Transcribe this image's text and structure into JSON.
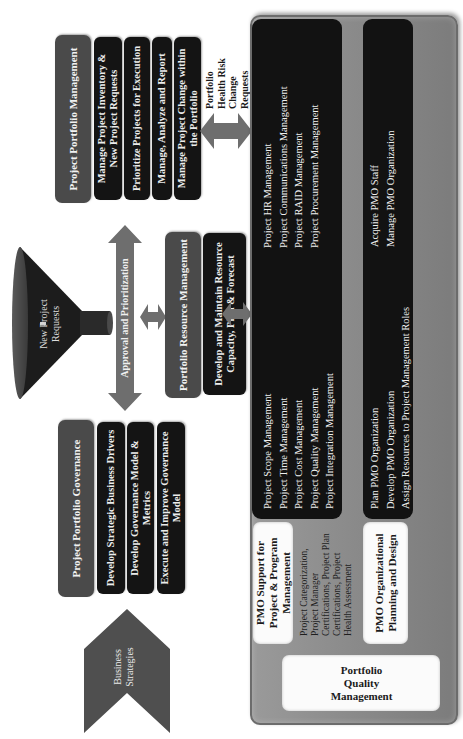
{
  "business_strategies": {
    "label_line1": "Business",
    "label_line2": "Strategies"
  },
  "governance": {
    "header": "Project Portfolio Governance",
    "items": [
      "Develop Strategic Business Drivers",
      "Develop Governance Model & Metrics",
      "Execute and Improve Governance Model"
    ]
  },
  "funnel": {
    "label": "New Project Requests"
  },
  "approval_arrow": {
    "label": "Approval and Prioritization"
  },
  "resource": {
    "header": "Portfolio Resource Management",
    "detail": "Develop and Maintain Resource Capacity, Plan & Forecast"
  },
  "portfolio_mgmt": {
    "header": "Project Portfolio Management",
    "items": [
      "Manage Project Inventory & New Project Requests",
      "Prioritize Projects for Execution",
      "Manage, Analyze and Report",
      "Manage Project Change within the Portfolio"
    ]
  },
  "feedback_arrow": {
    "label_lines": [
      "Portfolio",
      "Health Risk",
      "Change",
      "Requests"
    ]
  },
  "pmo_panel": {
    "support_box": "PMO Support for Project & Program Management",
    "support_desc": "Project Categorization, Project Manager Certifications, Project Plan Certifications, Project Health Assessment",
    "knowledge_areas_left": [
      "Project Scope Management",
      "Project Time Management",
      "Project Cost Management",
      "Project Quality Management",
      "Project Integration Management"
    ],
    "knowledge_areas_right": [
      "Project HR Management",
      "Project Communications Management",
      "Project RAID Management",
      "Project Procurement Management"
    ],
    "org_box": "PMO Organizational Planning and Design",
    "org_left": [
      "Plan PMO Organization",
      "Develop PMO Organization",
      "Assign Resources to Project Management Roles"
    ],
    "org_right": [
      "Acquire PMO Staff",
      "Manage PMO Organization"
    ],
    "quality_box": "Portfolio Quality Management"
  },
  "colors": {
    "header_gray": "#4a4a4a",
    "row_black": "#141414",
    "arrow_gray": "#6e6e6e",
    "panel_gray": "#8a8a8a",
    "funnel_dark": "#1a1a1a"
  }
}
